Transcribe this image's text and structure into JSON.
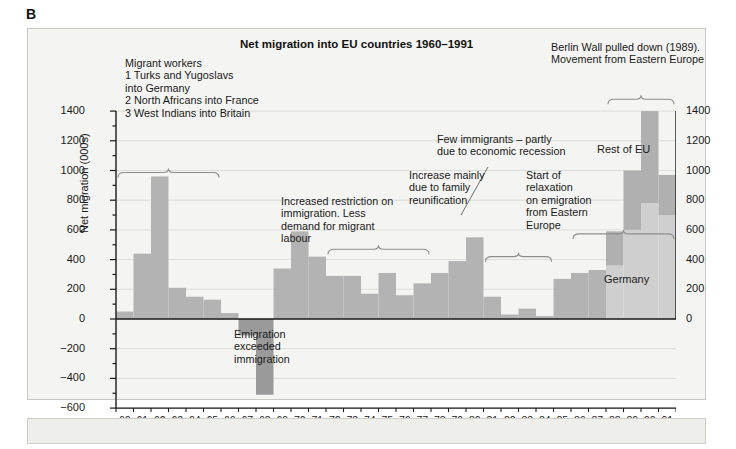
{
  "panel_letter": "B",
  "chart_title": "Net migration into EU countries 1960–1991",
  "axes": {
    "ylabel": "Net migration (000s)",
    "xlabel": "Year",
    "y_ticks_left": [
      "1400",
      "1200",
      "1000",
      "800",
      "600",
      "400",
      "200",
      "0",
      "−200",
      "−400",
      "−600"
    ],
    "y_ticks_right": [
      "1400",
      "1200",
      "1000",
      "800",
      "600",
      "400",
      "200",
      "0"
    ],
    "x_ticks": [
      "60",
      "61",
      "62",
      "63",
      "64",
      "65",
      "66",
      "67",
      "68",
      "69",
      "70",
      "71",
      "72",
      "73",
      "74",
      "75",
      "76",
      "77",
      "78",
      "79",
      "80",
      "81",
      "82",
      "83",
      "84",
      "85",
      "86",
      "87",
      "88",
      "89",
      "90",
      "91"
    ]
  },
  "legend": {
    "header": "Migrant workers",
    "items": [
      "1  Turks and Yugoslavs",
      "    into Germany",
      "2  North Africans into France",
      "3  West Indians into Britain"
    ]
  },
  "series_labels": {
    "rest_of_eu": "Rest of EU",
    "germany": "Germany"
  },
  "annotations": [
    {
      "id": "restriction",
      "text": "Increased restriction on\nimmigration. Less\ndemand for migrant\nlabour"
    },
    {
      "id": "family",
      "text": "Increase mainly\ndue to family\nreunification"
    },
    {
      "id": "recession",
      "text": "Few immigrants – partly\ndue to economic recession"
    },
    {
      "id": "relaxation",
      "text": "Start of\nrelaxation\non emigration\nfrom Eastern\nEurope"
    },
    {
      "id": "berlin",
      "text": "Berlin Wall pulled down (1989).\nMovement from Eastern Europe"
    },
    {
      "id": "emigration",
      "text": "Emigration\nexceeded\nimmigration"
    }
  ],
  "colors": {
    "bar_main": "#b3b3b3",
    "bar_germany": "#cfcfcf",
    "bar_rest_of_eu": "#b0b0b0",
    "panel_bg": "#f4f4f2",
    "grid": "#dcdcd8",
    "axis": "#1a1a1a"
  },
  "chart_data": {
    "type": "bar",
    "title": "Net migration into EU countries 1960–1991",
    "xlabel": "Year",
    "ylabel": "Net migration (000s)",
    "ylim": [
      -600,
      1400
    ],
    "grid": true,
    "legend_position": "inline-labels",
    "categories": [
      "60",
      "61",
      "62",
      "63",
      "64",
      "65",
      "66",
      "67",
      "68",
      "69",
      "70",
      "71",
      "72",
      "73",
      "74",
      "75",
      "76",
      "77",
      "78",
      "79",
      "80",
      "81",
      "82",
      "83",
      "84",
      "85",
      "86",
      "87",
      "88",
      "89",
      "90",
      "91"
    ],
    "series": [
      {
        "name": "Germany",
        "values": [
          50,
          440,
          960,
          210,
          150,
          130,
          40,
          -110,
          -510,
          340,
          590,
          420,
          290,
          290,
          170,
          310,
          160,
          240,
          310,
          390,
          550,
          150,
          30,
          70,
          20,
          270,
          310,
          330,
          360,
          600,
          780,
          700
        ]
      },
      {
        "name": "Rest of EU",
        "values": [
          0,
          0,
          0,
          0,
          0,
          0,
          0,
          0,
          0,
          0,
          0,
          0,
          0,
          0,
          0,
          0,
          0,
          0,
          0,
          0,
          0,
          0,
          0,
          0,
          0,
          0,
          0,
          0,
          230,
          400,
          620,
          270
        ]
      }
    ],
    "totals": [
      50,
      440,
      960,
      210,
      150,
      130,
      40,
      -110,
      -510,
      340,
      590,
      420,
      290,
      290,
      170,
      310,
      160,
      240,
      310,
      390,
      550,
      150,
      30,
      70,
      20,
      270,
      310,
      330,
      590,
      1000,
      1400,
      970
    ]
  }
}
